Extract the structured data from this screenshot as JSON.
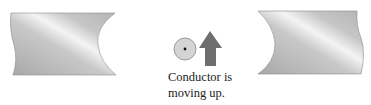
{
  "figure": {
    "left_magnet": {
      "label": "magnet-pole-left"
    },
    "right_magnet": {
      "label": "magnet-pole-right"
    },
    "conductor": {
      "symbol": "dot (current out of page)",
      "fill": "#d4d4d4",
      "stroke": "#888888"
    },
    "arrow": {
      "direction": "up",
      "fill": "#6e6e6e"
    },
    "caption": {
      "line1": "Conductor is",
      "line2": "moving up."
    },
    "colors": {
      "magnet_light": "#f2f2f2",
      "magnet_mid": "#c4c4c4",
      "magnet_dark": "#9a9a9a"
    }
  }
}
